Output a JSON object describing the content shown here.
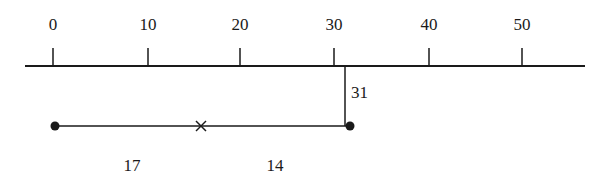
{
  "diagram": {
    "type": "number-line",
    "axis": {
      "min_visible": -3,
      "max_visible": 56,
      "tick_values": [
        0,
        10,
        20,
        30,
        40,
        50
      ],
      "tick_labels": [
        "0",
        "10",
        "20",
        "30",
        "40",
        "50"
      ]
    },
    "marker": {
      "value": 31,
      "label": "31"
    },
    "segment": {
      "start": 0,
      "end": 31,
      "start_point": "filled-dot",
      "end_point": "filled-dot",
      "midpoint_mark": "cross",
      "midpoint_value": 15.5
    },
    "part_labels": [
      {
        "label": "17",
        "description": "left part"
      },
      {
        "label": "14",
        "description": "right part"
      }
    ],
    "colors": {
      "line": "#1a1a1a",
      "background": "#ffffff"
    }
  }
}
